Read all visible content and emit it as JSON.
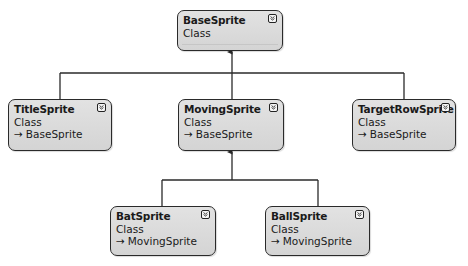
{
  "diagram": {
    "type": "class-diagram",
    "colors": {
      "box_fill": "#d9d9d9",
      "box_border": "#2a2a2a",
      "line": "#2a2a2a",
      "background": "#ffffff"
    },
    "classes": [
      {
        "id": "base",
        "name": "BaseSprite",
        "kind": "Class",
        "base": ""
      },
      {
        "id": "title",
        "name": "TitleSprite",
        "kind": "Class",
        "base": "BaseSprite"
      },
      {
        "id": "moving",
        "name": "MovingSprite",
        "kind": "Class",
        "base": "BaseSprite"
      },
      {
        "id": "target",
        "name": "TargetRowSprite",
        "kind": "Class",
        "base": "BaseSprite"
      },
      {
        "id": "bat",
        "name": "BatSprite",
        "kind": "Class",
        "base": "MovingSprite"
      },
      {
        "id": "ball",
        "name": "BallSprite",
        "kind": "Class",
        "base": "MovingSprite"
      }
    ],
    "inheritance": [
      {
        "from": "TitleSprite",
        "to": "BaseSprite"
      },
      {
        "from": "MovingSprite",
        "to": "BaseSprite"
      },
      {
        "from": "TargetRowSprite",
        "to": "BaseSprite"
      },
      {
        "from": "BatSprite",
        "to": "MovingSprite"
      },
      {
        "from": "BallSprite",
        "to": "MovingSprite"
      }
    ],
    "icons": {
      "toggle": "collapse-chevron-icon",
      "base_arrow": "→"
    }
  }
}
